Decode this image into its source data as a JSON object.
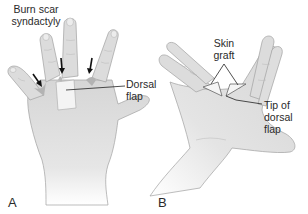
{
  "figure": {
    "panels": [
      {
        "id": "A",
        "label": "A",
        "view": "dorsal hand",
        "annotations": {
          "top_label_line1": "Burn scar",
          "top_label_line2": "syndactyly",
          "side_label_line1": "Dorsal",
          "side_label_line2": "flap"
        },
        "arrow_count": 3
      },
      {
        "id": "B",
        "label": "B",
        "view": "palmar hand",
        "annotations": {
          "top_label_line1": "Skin",
          "top_label_line2": "graft",
          "side_label_line1": "Tip of",
          "side_label_line2": "dorsal",
          "side_label_line3": "flap"
        }
      }
    ],
    "colors": {
      "skin": "#d9d9d9",
      "skin_light": "#ececec",
      "outline": "#9a9a9a",
      "scar": "#b8b8b8",
      "text": "#2a2a2a",
      "leader": "#222222"
    }
  }
}
